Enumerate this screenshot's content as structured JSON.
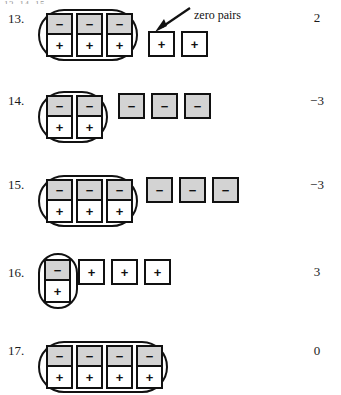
{
  "page": {
    "top_cut_text": "13. 14. 15.",
    "tile_symbols": {
      "negative": "−",
      "positive": "+"
    },
    "colors": {
      "negative_tile_fill": "#d3d3d3",
      "positive_tile_fill": "#ffffff",
      "outline": "#111111",
      "text": "#1a1a1a"
    }
  },
  "callout": {
    "label": "zero pairs",
    "arrow_name": "arrow-pointing-to-zero-pairs"
  },
  "problems": [
    {
      "number": "13.",
      "grouped_pairs": 3,
      "loose_tiles": [
        "+",
        "+"
      ],
      "loose_sign": "positive",
      "answer": "2"
    },
    {
      "number": "14.",
      "grouped_pairs": 2,
      "loose_tiles": [
        "−",
        "−",
        "−"
      ],
      "loose_sign": "negative",
      "answer": "−3"
    },
    {
      "number": "15.",
      "grouped_pairs": 3,
      "loose_tiles": [
        "−",
        "−",
        "−"
      ],
      "loose_sign": "negative",
      "answer": "−3"
    },
    {
      "number": "16.",
      "grouped_pairs": 1,
      "loose_tiles": [
        "+",
        "+",
        "+"
      ],
      "loose_sign": "positive",
      "answer": "3"
    },
    {
      "number": "17.",
      "grouped_pairs": 4,
      "loose_tiles": [],
      "loose_sign": "none",
      "answer": "0"
    }
  ]
}
